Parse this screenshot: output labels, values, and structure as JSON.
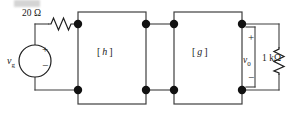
{
  "figure": {
    "line_color": "#3f3f3f",
    "node_color": "#111111",
    "text_color": "#1a1a1a"
  },
  "source": {
    "name": "independent voltage source",
    "label": "v",
    "label_sub": "g",
    "plus": "+",
    "minus": "−"
  },
  "series_resistor": {
    "value": "20",
    "unit": "Ω",
    "label": "20 Ω"
  },
  "two_ports": [
    {
      "bracket_open": "[",
      "symbol": "h",
      "bracket_close": "]"
    },
    {
      "bracket_open": "[",
      "symbol": "g",
      "bracket_close": "]"
    }
  ],
  "output": {
    "voltage_label": "v",
    "voltage_sub": "0",
    "plus": "+",
    "minus": "−"
  },
  "load_resistor": {
    "value": "1",
    "unit": "kΩ",
    "label": "1 kΩ"
  }
}
